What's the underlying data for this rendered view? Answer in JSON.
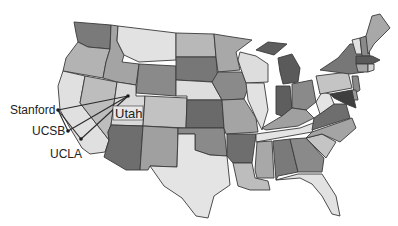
{
  "map": {
    "title": "ARPANET initial nodes on US map",
    "style": "grayscale-beveled",
    "colors": {
      "dark": "#6e6e6e",
      "mid_dark": "#8a8a8a",
      "mid": "#a6a6a6",
      "light": "#c4c4c4",
      "lightest": "#e2e2e2",
      "border": "#3a3a3a",
      "link": "#2a2a2a"
    },
    "nodes": [
      {
        "id": "stanford",
        "label": "Stanford",
        "x": 58,
        "y": 110
      },
      {
        "id": "ucsb",
        "label": "UCSB",
        "x": 68,
        "y": 131
      },
      {
        "id": "ucla",
        "label": "UCLA",
        "x": 81,
        "y": 139
      },
      {
        "id": "utah",
        "label": "Utah",
        "x": 128,
        "y": 96
      }
    ],
    "links": [
      {
        "from": "stanford",
        "to": "utah"
      },
      {
        "from": "stanford",
        "to": "ucla"
      },
      {
        "from": "ucsb",
        "to": "utah"
      },
      {
        "from": "ucla",
        "to": "utah"
      }
    ],
    "labels": {
      "stanford": "Stanford",
      "ucsb": "UCSB",
      "ucla": "UCLA",
      "utah": "Utah"
    }
  }
}
